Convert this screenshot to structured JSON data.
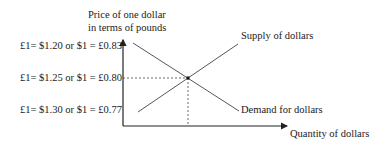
{
  "diagram": {
    "y_axis_label_line1": "Price of one dollar",
    "y_axis_label_line2": "in terms of pounds",
    "x_axis_label": "Quantity of dollars",
    "price_levels": [
      "£1= $1.20 or $1 = £0.83",
      "£1= $1.25 or $1 = £0.80",
      "£1= $1.30 or $1 = £0.77"
    ],
    "supply_label": "Supply of dollars",
    "demand_label": "Demand for dollars",
    "equilibrium_price": "£1= $1.25 or $1 = £0.80",
    "colors": {
      "line": "#333333",
      "text": "#1a1a1a",
      "background": "#ffffff"
    }
  }
}
